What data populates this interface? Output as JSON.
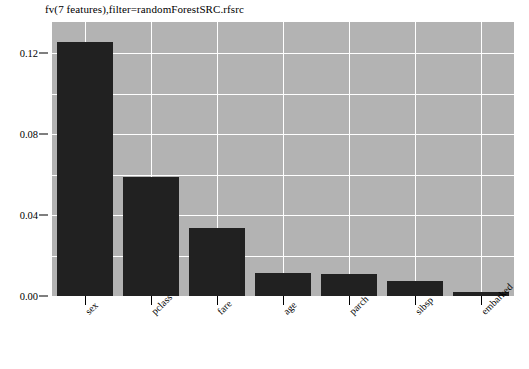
{
  "chart_data": {
    "type": "bar",
    "title": "fv(7 features),filter=randomForestSRC.rfsrc",
    "xlabel": "",
    "ylabel": "",
    "categories": [
      "sex",
      "pclass",
      "fare",
      "age",
      "parch",
      "sibsp",
      "embarked"
    ],
    "values": [
      0.1254,
      0.0588,
      0.0336,
      0.0114,
      0.0109,
      0.0074,
      0.002
    ],
    "ylim": [
      0.0,
      0.1353
    ],
    "y_ticks": [
      0.0,
      0.04,
      0.08,
      0.12
    ],
    "y_tick_labels": [
      "0.00",
      "0.04",
      "0.08",
      "0.12"
    ],
    "y_minor_ticks": [
      0.02,
      0.06,
      0.1,
      0.14
    ],
    "grid": true,
    "legend": null,
    "bar_color": "#212121",
    "panel_color": "#b3b3b3",
    "grid_color": "#ffffff",
    "background_color": "#ffffff"
  }
}
